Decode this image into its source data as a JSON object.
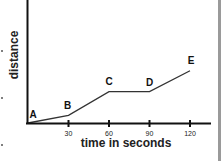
{
  "chart_data": {
    "type": "line",
    "title": "",
    "xlabel": "time in seconds",
    "ylabel": "distance",
    "x_ticks": [
      30,
      60,
      90,
      120
    ],
    "xlim": [
      0,
      130
    ],
    "ylim": [
      0,
      100
    ],
    "grid": false,
    "legend": null,
    "series": [
      {
        "name": "distance vs time",
        "points": [
          {
            "label": "A",
            "x": 0,
            "y": 0
          },
          {
            "label": "B",
            "x": 30,
            "y": 14
          },
          {
            "label": "C",
            "x": 60,
            "y": 57
          },
          {
            "label": "D",
            "x": 90,
            "y": 57
          },
          {
            "label": "E",
            "x": 120,
            "y": 95
          }
        ]
      }
    ]
  },
  "colors": {
    "axis": "#111111",
    "line": "#333333",
    "side_bar": "#9a9a9a"
  }
}
